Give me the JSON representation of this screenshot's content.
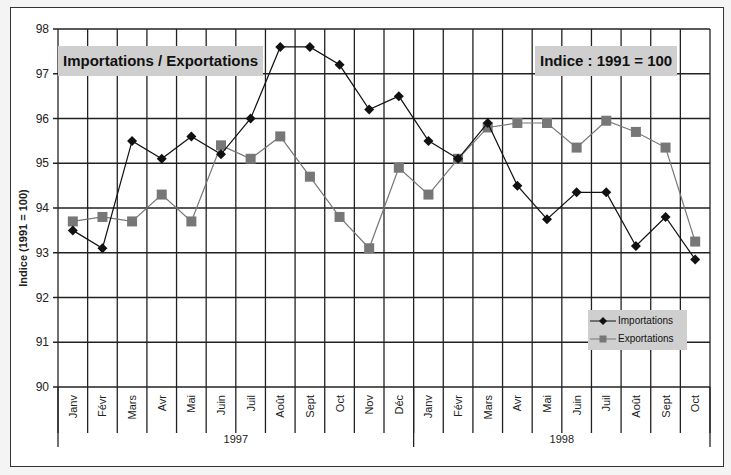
{
  "chart_data": {
    "type": "line",
    "title": "Importations / Exportations",
    "subtitle": "Indice : 1991 = 100",
    "xlabel": "",
    "ylabel": "Indice (1991 = 100)",
    "ylim": [
      90,
      98
    ],
    "yticks": [
      90,
      91,
      92,
      93,
      94,
      95,
      96,
      97,
      98
    ],
    "grid": true,
    "legend_position": "bottom-right inside",
    "categories": [
      "Janv",
      "Févr",
      "Mars",
      "Avr",
      "Mai",
      "Juin",
      "Juil",
      "Août",
      "Sept",
      "Oct",
      "Nov",
      "Déc",
      "Janv",
      "Févr",
      "Mars",
      "Avr",
      "Mai",
      "Juin",
      "Juil",
      "Août",
      "Sept",
      "Oct"
    ],
    "category_groups": [
      {
        "label": "1997",
        "start": 0,
        "count": 12
      },
      {
        "label": "1998",
        "start": 12,
        "count": 10
      }
    ],
    "series": [
      {
        "name": "Importations",
        "marker": "diamond",
        "color": "#111111",
        "values": [
          93.5,
          93.1,
          95.5,
          95.1,
          95.6,
          95.2,
          96.0,
          97.6,
          97.6,
          97.2,
          96.2,
          96.5,
          95.5,
          95.1,
          95.9,
          94.5,
          93.75,
          94.35,
          94.35,
          93.15,
          93.8,
          92.85
        ]
      },
      {
        "name": "Exportations",
        "marker": "square",
        "color": "#777777",
        "values": [
          93.7,
          93.8,
          93.7,
          94.3,
          93.7,
          95.4,
          95.1,
          95.6,
          94.7,
          93.8,
          93.1,
          94.9,
          94.3,
          95.1,
          95.8,
          95.9,
          95.9,
          95.35,
          95.95,
          95.7,
          95.35,
          93.25
        ]
      }
    ]
  },
  "labels": {
    "title_box": "Importations / Exportations",
    "index_box": "Indice : 1991 = 100",
    "legend_import": "Importations",
    "legend_export": "Exportations"
  }
}
